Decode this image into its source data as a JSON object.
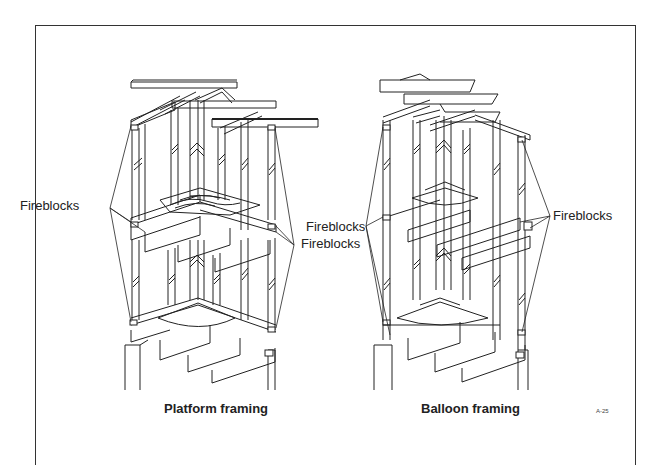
{
  "figure": {
    "id_label": "A-25",
    "panels": [
      {
        "caption": "Platform framing",
        "callouts": [
          {
            "text": "Fireblocks",
            "side": "left"
          },
          {
            "text": "Fireblocks",
            "side": "right"
          }
        ]
      },
      {
        "caption": "Balloon framing",
        "callouts": [
          {
            "text": "Fireblocks",
            "side": "left"
          },
          {
            "text": "Fireblocks",
            "side": "right"
          }
        ]
      }
    ]
  },
  "colors": {
    "line": "#222222",
    "background": "#ffffff",
    "frame": "#333333"
  }
}
